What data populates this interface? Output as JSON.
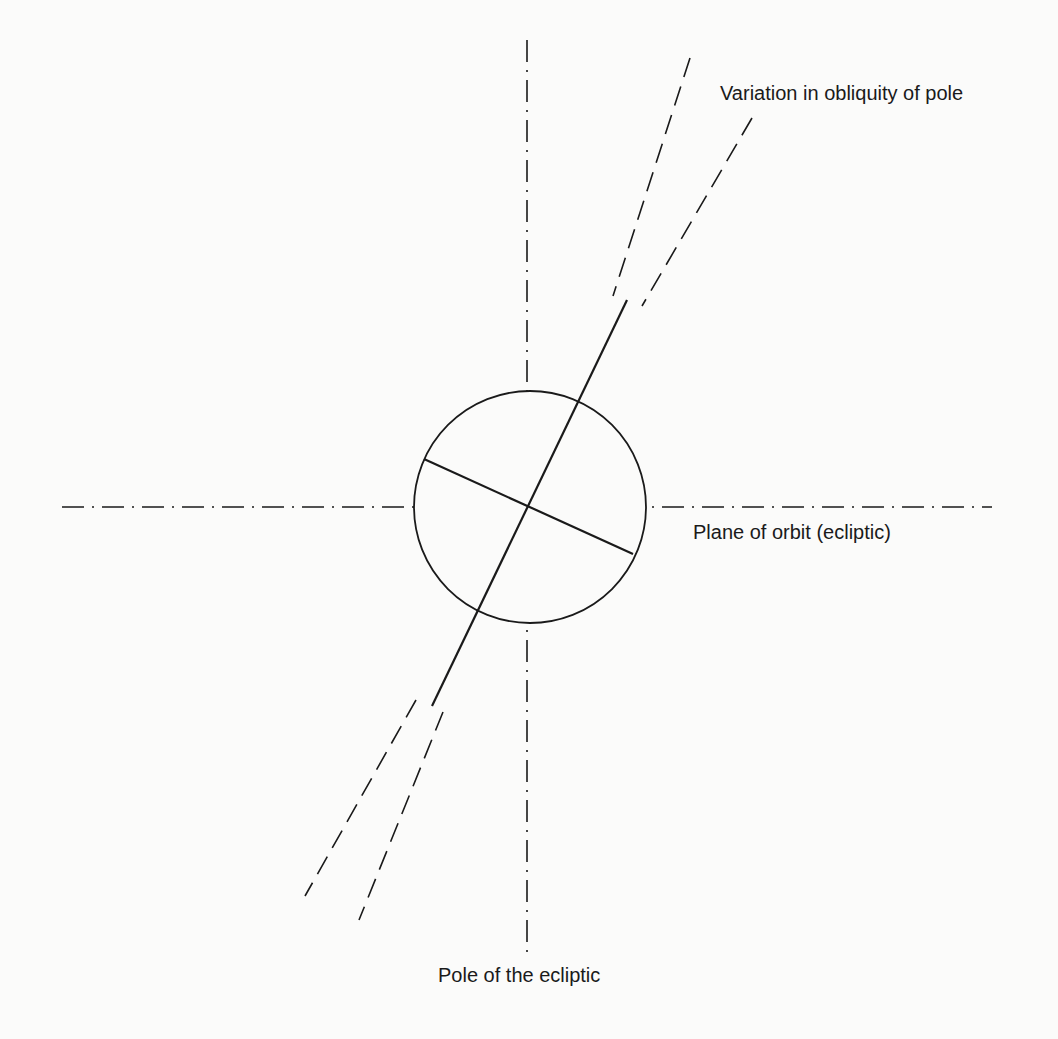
{
  "diagram": {
    "labels": {
      "obliquity": "Variation in obliquity of pole",
      "orbit_plane": "Plane of orbit (ecliptic)",
      "ecliptic_pole": "Pole of the ecliptic"
    },
    "colors": {
      "background": "#fbfbfa",
      "ink": "#1a1a1a"
    }
  }
}
